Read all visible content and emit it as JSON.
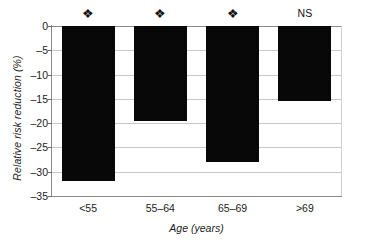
{
  "chart_data": {
    "type": "bar",
    "title": "",
    "xlabel": "Age (years)",
    "ylabel": "Relative risk reduction (%)",
    "categories": [
      "<55",
      "55–64",
      "65–69",
      ">69"
    ],
    "values": [
      -32,
      -19.5,
      -28,
      -15.5
    ],
    "annotations": [
      "❖",
      "❖",
      "❖",
      "NS"
    ],
    "annotation_meanings": [
      "significant",
      "significant",
      "significant",
      "not significant"
    ],
    "ylim": [
      -35,
      0
    ],
    "yticks": [
      0,
      -5,
      -10,
      -15,
      -20,
      -25,
      -30,
      -35
    ],
    "ytick_labels": [
      "0",
      "–5",
      "–10",
      "–15",
      "–20",
      "–25",
      "–30",
      "–35"
    ],
    "grid": true,
    "grid_axis": "y",
    "legend": null,
    "bar_color": "#080808",
    "grid_color": "#c8c8c8",
    "axis_color": "#8a8a8a"
  },
  "axes": {
    "y_title": "Relative risk reduction (%)",
    "x_title": "Age (years)"
  }
}
